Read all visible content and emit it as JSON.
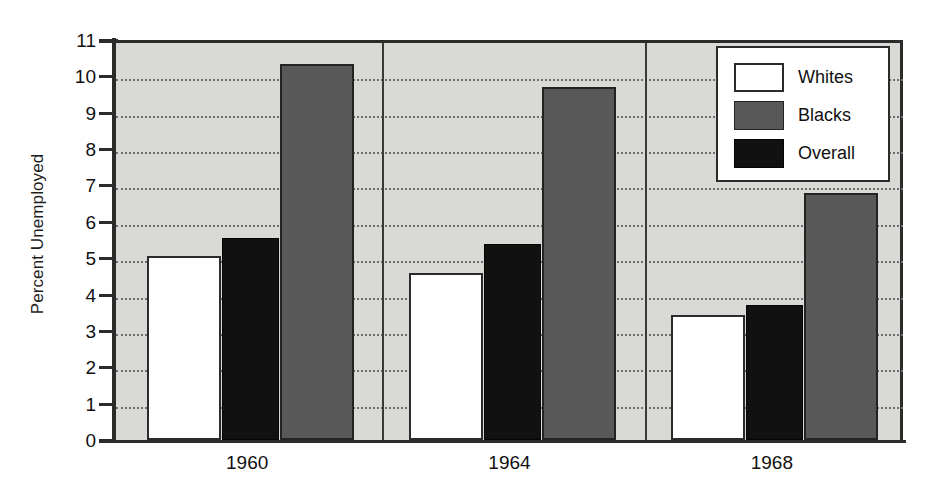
{
  "chart_data": {
    "type": "bar",
    "title": "",
    "subtitle": "",
    "xlabel": "",
    "ylabel": "Percent Unemployed",
    "categories": [
      "1960",
      "1964",
      "1968"
    ],
    "series": [
      {
        "name": "Whites",
        "color": "#ffffff",
        "values": [
          5.05,
          4.6,
          3.45
        ]
      },
      {
        "name": "Overall",
        "color": "#111111",
        "values": [
          5.55,
          5.4,
          3.7
        ]
      },
      {
        "name": "Blacks",
        "color": "#585858",
        "values": [
          10.35,
          9.7,
          6.8
        ]
      }
    ],
    "bar_order_in_group": [
      "Whites",
      "Overall",
      "Blacks"
    ],
    "ylim": [
      0,
      11
    ],
    "ytick_step": 1,
    "ytick_labels": [
      "0",
      "1",
      "2",
      "3",
      "4",
      "5",
      "6",
      "7",
      "8",
      "9",
      "10",
      "11"
    ],
    "grid": true,
    "grid_style": "dotted",
    "grid_axis": "y",
    "group_separators": true,
    "legend_position": "top-right",
    "legend_entries": [
      {
        "label": "Whites",
        "swatch": "fill-white"
      },
      {
        "label": "Blacks",
        "swatch": "fill-gray"
      },
      {
        "label": "Overall",
        "swatch": "fill-black"
      }
    ],
    "plot_background": "#d9d9d5",
    "axis_color": "#2b2b2b",
    "gridline_color": "#6d6d6d"
  }
}
